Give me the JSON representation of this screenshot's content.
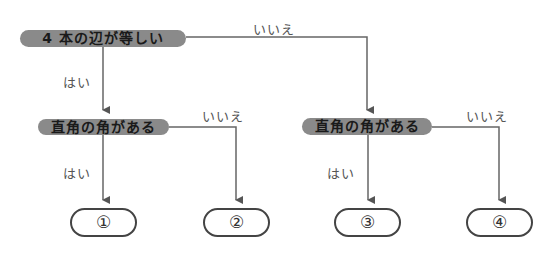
{
  "diagram": {
    "type": "flowchart",
    "nodes": {
      "q1": {
        "label": "4 本の辺が等しい"
      },
      "q2_left": {
        "label": "直角の角がある"
      },
      "q2_right": {
        "label": "直角の角がある"
      },
      "r1": {
        "label": "①"
      },
      "r2": {
        "label": "②"
      },
      "r3": {
        "label": "③"
      },
      "r4": {
        "label": "④"
      }
    },
    "edge_labels": {
      "q1_yes": "はい",
      "q1_no": "いいえ",
      "q2l_yes": "はい",
      "q2l_no": "いいえ",
      "q2r_yes": "はい",
      "q2r_no": "いいえ"
    },
    "edges": [
      {
        "from": "q1",
        "to": "q2_left",
        "label": "はい"
      },
      {
        "from": "q1",
        "to": "q2_right",
        "label": "いいえ"
      },
      {
        "from": "q2_left",
        "to": "r1",
        "label": "はい"
      },
      {
        "from": "q2_left",
        "to": "r2",
        "label": "いいえ"
      },
      {
        "from": "q2_right",
        "to": "r3",
        "label": "はい"
      },
      {
        "from": "q2_right",
        "to": "r4",
        "label": "いいえ"
      }
    ],
    "colors": {
      "decision_fill": "#8a8a8a",
      "line": "#555555",
      "terminal_border": "#444444"
    }
  }
}
